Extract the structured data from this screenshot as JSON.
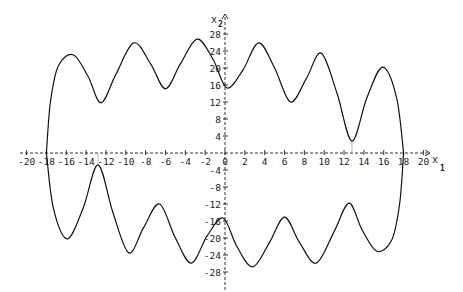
{
  "chart_data": {
    "type": "line",
    "title": "",
    "xlabel": "x",
    "xlabel_subscript": "1",
    "ylabel": "x",
    "ylabel_subscript": "2",
    "xlim": [
      -20,
      20
    ],
    "ylim": [
      -28,
      28
    ],
    "grid": false,
    "legend": null,
    "x_ticks": [
      -20,
      -18,
      -16,
      -14,
      -12,
      -10,
      -8,
      -6,
      -4,
      -2,
      0,
      2,
      4,
      6,
      8,
      10,
      12,
      14,
      16,
      18,
      20
    ],
    "y_ticks": [
      -28,
      -24,
      -20,
      -16,
      -12,
      -8,
      -4,
      4,
      8,
      12,
      16,
      20,
      24,
      28
    ],
    "series": [
      {
        "name": "upper branch",
        "x": [
          -18.0,
          -17.6,
          -16.8,
          -15.3,
          -13.8,
          -12.5,
          -11.0,
          -9.2,
          -7.5,
          -6.0,
          -4.5,
          -2.8,
          -1.2,
          0.2,
          1.8,
          3.4,
          5.0,
          6.6,
          8.2,
          9.7,
          11.3,
          12.8,
          14.3,
          15.9,
          17.3,
          18.0
        ],
        "y": [
          0.0,
          12.0,
          20.5,
          23.1,
          18.0,
          11.8,
          18.5,
          25.9,
          21.0,
          15.1,
          21.0,
          26.8,
          22.0,
          15.3,
          19.5,
          25.9,
          20.0,
          12.0,
          17.5,
          23.5,
          14.0,
          2.8,
          13.0,
          20.2,
          13.0,
          0.0
        ]
      },
      {
        "name": "lower branch",
        "x": [
          -18.0,
          -17.3,
          -15.9,
          -14.3,
          -12.8,
          -11.3,
          -9.7,
          -8.2,
          -6.6,
          -5.0,
          -3.4,
          -1.8,
          -0.2,
          1.2,
          2.8,
          4.5,
          6.0,
          7.5,
          9.2,
          11.0,
          12.5,
          13.8,
          15.3,
          16.8,
          17.6,
          18.0
        ],
        "y": [
          0.0,
          -13.0,
          -20.2,
          -13.0,
          -2.8,
          -14.0,
          -23.5,
          -17.5,
          -12.0,
          -20.0,
          -25.9,
          -19.5,
          -15.3,
          -22.0,
          -26.8,
          -21.0,
          -15.1,
          -21.0,
          -25.9,
          -18.5,
          -11.8,
          -18.0,
          -23.1,
          -20.5,
          -12.0,
          0.0
        ]
      }
    ],
    "annotations": [
      {
        "type": "vertical-dropline",
        "x": 12.8,
        "from_y": 2.8,
        "to_y": 0
      },
      {
        "type": "vertical-dropline",
        "x": -12.8,
        "from_y": -2.8,
        "to_y": 0
      }
    ]
  }
}
